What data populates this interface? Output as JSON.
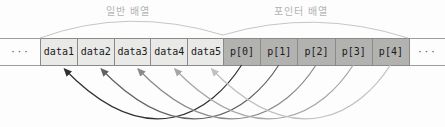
{
  "diagram": {
    "regular_array_label": "일반 배열",
    "pointer_array_label": "포인터 배열",
    "left_ellipsis": "···",
    "right_ellipsis": "···",
    "data_cells": [
      "data1",
      "data2",
      "data3",
      "data4",
      "data5"
    ],
    "pointer_cells": [
      "p[0]",
      "p[1]",
      "p[2]",
      "p[3]",
      "p[4]"
    ],
    "arrows": [
      {
        "from": "p[0]",
        "to": "data1",
        "color": "#303030"
      },
      {
        "from": "p[1]",
        "to": "data2",
        "color": "#636363"
      },
      {
        "from": "p[2]",
        "to": "data3",
        "color": "#8a8a8a"
      },
      {
        "from": "p[3]",
        "to": "data4",
        "color": "#a6a6a6"
      },
      {
        "from": "p[4]",
        "to": "data5",
        "color": "#c0c0c0"
      }
    ],
    "colors": {
      "data_cell_bg": "#e9e9e7",
      "pointer_cell_bg": "#b2b2b0",
      "cell_border": "#8a8a8a",
      "cell_text": "#1a1a1a",
      "strip_line": "#9c9c9c",
      "label_text": "#b3b3b3",
      "arc_line": "#c6c6c6"
    }
  }
}
